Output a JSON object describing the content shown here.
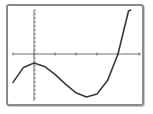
{
  "chart_data": {
    "type": "line",
    "title": "",
    "xlabel": "",
    "ylabel": "",
    "grid": false,
    "legend": null,
    "axis_ranges": {
      "x": [
        -1,
        5
      ],
      "y": [
        -11,
        11
      ]
    },
    "x_tick_step": 1,
    "y_tick_step": 1,
    "series": [
      {
        "name": "cubic function",
        "x": [
          -1,
          -0.5,
          0,
          0.5,
          1,
          1.5,
          2,
          2.5,
          3,
          3.5,
          4,
          4.5,
          4.6
        ],
        "y": [
          -7.1,
          -3.35,
          -2.25,
          -3.1,
          -5.1,
          -7.55,
          -9.7,
          -10.75,
          -10.0,
          -6.65,
          0.0,
          10.75,
          11.0
        ]
      }
    ],
    "features": {
      "local_max": {
        "x": 0,
        "y": -2.25
      },
      "local_min": {
        "x": 2.5,
        "y": -10.75
      },
      "x_intercept": 4.0
    }
  },
  "style": {
    "frame_color": "#8a8a8a",
    "axis_color": "#6e6e6e",
    "curve_color": "#3a3a3a"
  },
  "layout": {
    "origin_px": {
      "x": 34,
      "y": 54
    },
    "px_per_x_unit": 21,
    "px_per_y_unit": 4,
    "x_axis_px": [
      13,
      141
    ],
    "y_axis_px": [
      10,
      101
    ]
  }
}
